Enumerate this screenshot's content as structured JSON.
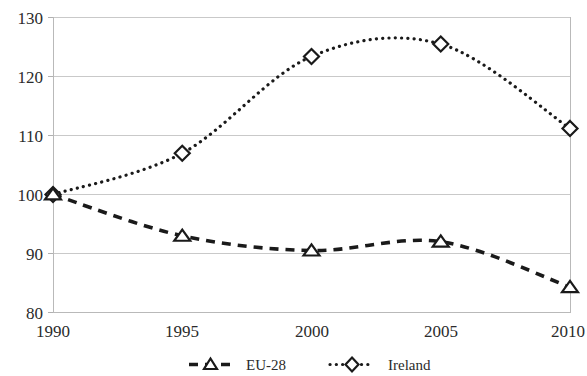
{
  "chart_data": {
    "type": "line",
    "title": "",
    "subtitle": "",
    "xlabel": "",
    "ylabel": "",
    "x": [
      1990,
      1995,
      2000,
      2005,
      2010
    ],
    "xtick_labels": [
      "1990",
      "1995",
      "2000",
      "2005",
      "2010"
    ],
    "ytick_labels": [
      "80",
      "90",
      "100",
      "110",
      "120",
      "130"
    ],
    "ytick_values": [
      80,
      90,
      100,
      110,
      120,
      130
    ],
    "xlim": [
      1990,
      2010
    ],
    "ylim": [
      80,
      130
    ],
    "grid": true,
    "grid_axis": "y",
    "legend_position": "bottom",
    "smoothing": "spline",
    "series": [
      {
        "name": "EU-28",
        "values": [
          100.0,
          93.0,
          90.5,
          92.0,
          84.3
        ],
        "line_style": "dashed",
        "marker": "triangle-open",
        "color": "#1a1a1a"
      },
      {
        "name": "Ireland",
        "values": [
          100.0,
          107.0,
          123.4,
          125.5,
          111.2
        ],
        "line_style": "dotted",
        "marker": "diamond-open",
        "color": "#1a1a1a"
      }
    ]
  },
  "legend": {
    "items": [
      {
        "label": "EU-28"
      },
      {
        "label": "Ireland"
      }
    ]
  },
  "axes": {
    "y": {
      "ticks": [
        {
          "label": "130"
        },
        {
          "label": "120"
        },
        {
          "label": "110"
        },
        {
          "label": "100"
        },
        {
          "label": "90"
        },
        {
          "label": "80"
        }
      ]
    },
    "x": {
      "ticks": [
        {
          "label": "1990"
        },
        {
          "label": "1995"
        },
        {
          "label": "2000"
        },
        {
          "label": "2005"
        },
        {
          "label": "2010"
        }
      ]
    }
  },
  "colors": {
    "gridline": "#c9c9c9",
    "series": "#1a1a1a",
    "text": "#2b2b2b",
    "background": "#ffffff"
  }
}
